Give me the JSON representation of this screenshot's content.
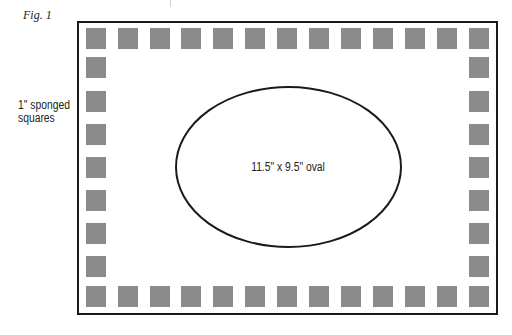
{
  "figure": {
    "label": "Fig. 1",
    "side_label_line1": "1\" sponged",
    "side_label_line2": "squares",
    "oval_label": "11.5\" x 9.5\" oval"
  },
  "colors": {
    "frame": "#1a1a1a",
    "square": "#8b8b8b",
    "oval_stroke": "#1a1a1a"
  },
  "layout": {
    "top_row_count": 13,
    "side_column_count": 9,
    "top_row_x": [
      86,
      118,
      150,
      181,
      213,
      245,
      277,
      309,
      341,
      373,
      405,
      437,
      469
    ],
    "column_y": [
      28,
      57,
      91,
      124,
      157,
      190,
      223,
      256,
      286
    ],
    "oval": {
      "cx": 288.5,
      "cy": 167,
      "rx": 112.5,
      "ry": 80
    }
  }
}
